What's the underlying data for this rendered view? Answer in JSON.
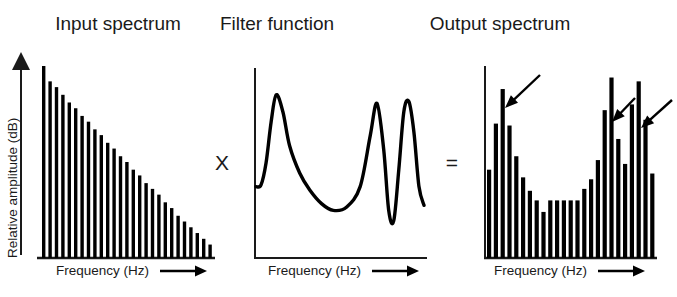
{
  "figure": {
    "caption_type": "source-filter-model-diagram",
    "operators": [
      {
        "name": "multiply",
        "symbol": "X",
        "x": 222,
        "y": 170
      },
      {
        "name": "equals",
        "symbol": "=",
        "x": 452,
        "y": 170
      }
    ]
  },
  "panels": [
    {
      "id": "input",
      "title": "Input spectrum",
      "title_x": 118,
      "title_y": 30,
      "ylabel": "Relative amplitude (dB)",
      "xlabel": "Frequency (Hz)",
      "xlabel_x": 56,
      "xlabel_y": 275,
      "has_y_arrow": true,
      "axis": {
        "x0": 40,
        "y0": 258,
        "x1": 213,
        "ytop": 66
      }
    },
    {
      "id": "filter",
      "title": "Filter function",
      "title_x": 277,
      "title_y": 30,
      "ylabel": "",
      "xlabel": "Frequency (Hz)",
      "xlabel_x": 268,
      "xlabel_y": 275,
      "has_y_arrow": false,
      "axis": {
        "x0": 255,
        "y0": 258,
        "x1": 426,
        "ytop": 68
      }
    },
    {
      "id": "output",
      "title": "Output spectrum",
      "title_x": 500,
      "title_y": 30,
      "ylabel": "",
      "xlabel": "Frequency (Hz)",
      "xlabel_x": 494,
      "xlabel_y": 275,
      "has_y_arrow": false,
      "axis": {
        "x0": 485,
        "y0": 258,
        "x1": 655,
        "ytop": 66
      }
    }
  ],
  "chart_data": [
    {
      "type": "bar",
      "id": "input-spectrum",
      "title": "Input spectrum",
      "xlabel": "Frequency (Hz)",
      "ylabel": "Relative amplitude (dB)",
      "grid": false,
      "legend": "none",
      "ylim": [
        0,
        1
      ],
      "description": "Harmonic source spectrum decaying linearly with frequency",
      "categories": [
        "h1",
        "h2",
        "h3",
        "h4",
        "h5",
        "h6",
        "h7",
        "h8",
        "h9",
        "h10",
        "h11",
        "h12",
        "h13",
        "h14",
        "h15",
        "h16",
        "h17",
        "h18",
        "h19",
        "h20",
        "h21",
        "h22",
        "h23",
        "h24",
        "h25",
        "h26",
        "h27"
      ],
      "values": [
        1.0,
        0.92,
        0.89,
        0.85,
        0.81,
        0.78,
        0.74,
        0.71,
        0.67,
        0.64,
        0.6,
        0.57,
        0.53,
        0.5,
        0.46,
        0.43,
        0.39,
        0.36,
        0.33,
        0.29,
        0.26,
        0.22,
        0.19,
        0.16,
        0.13,
        0.1,
        0.07
      ]
    },
    {
      "type": "line",
      "id": "filter-function",
      "title": "Filter function",
      "xlabel": "Frequency (Hz)",
      "ylabel": "",
      "grid": false,
      "legend": "none",
      "ylim": [
        0,
        1
      ],
      "description": "Vocal tract transfer function with three resonant peaks (formants) and an antiresonance notch",
      "x": [
        0.0,
        0.03,
        0.06,
        0.09,
        0.12,
        0.16,
        0.2,
        0.26,
        0.32,
        0.39,
        0.46,
        0.54,
        0.62,
        0.68,
        0.72,
        0.76,
        0.79,
        0.82,
        0.85,
        0.88,
        0.91,
        0.94,
        0.97,
        1.0
      ],
      "y": [
        0.42,
        0.43,
        0.56,
        0.8,
        0.96,
        0.86,
        0.66,
        0.5,
        0.4,
        0.32,
        0.28,
        0.3,
        0.42,
        0.72,
        0.91,
        0.64,
        0.28,
        0.22,
        0.52,
        0.86,
        0.92,
        0.74,
        0.42,
        0.31
      ],
      "peaks": [
        {
          "name": "F1",
          "x": 0.12,
          "y": 0.96
        },
        {
          "name": "F2",
          "x": 0.72,
          "y": 0.91
        },
        {
          "name": "F3",
          "x": 0.91,
          "y": 0.92
        }
      ],
      "notch": {
        "x": 0.81,
        "y": 0.21
      }
    },
    {
      "type": "bar",
      "id": "output-spectrum",
      "title": "Output spectrum",
      "xlabel": "Frequency (Hz)",
      "ylabel": "",
      "grid": false,
      "legend": "none",
      "ylim": [
        0,
        1
      ],
      "description": "Radiated spectrum: input harmonics shaped by filter; arrows mark the three formant peaks",
      "categories": [
        "h1",
        "h2",
        "h3",
        "h4",
        "h5",
        "h6",
        "h7",
        "h8",
        "h9",
        "h10",
        "h11",
        "h12",
        "h13",
        "h14",
        "h15",
        "h16",
        "h17",
        "h18",
        "h19",
        "h20",
        "h21",
        "h22",
        "h23",
        "h24",
        "h25"
      ],
      "values": [
        0.46,
        0.7,
        0.88,
        0.69,
        0.53,
        0.42,
        0.35,
        0.3,
        0.24,
        0.3,
        0.3,
        0.3,
        0.3,
        0.3,
        0.36,
        0.41,
        0.51,
        0.77,
        0.94,
        0.62,
        0.49,
        0.8,
        0.92,
        0.72,
        0.44
      ],
      "annotations": [
        {
          "type": "arrow",
          "label": "formant-1-arrow",
          "points_to_bar": 3,
          "from": [
            540,
            75
          ],
          "to": [
            505,
            108
          ]
        },
        {
          "type": "arrow",
          "label": "formant-2-arrow",
          "points_to_bar": 19,
          "from": [
            635,
            98
          ],
          "to": [
            612,
            122
          ]
        },
        {
          "type": "arrow",
          "label": "formant-3-arrow",
          "points_to_bar": 23,
          "from": [
            672,
            100
          ],
          "to": [
            641,
            128
          ]
        }
      ]
    }
  ]
}
